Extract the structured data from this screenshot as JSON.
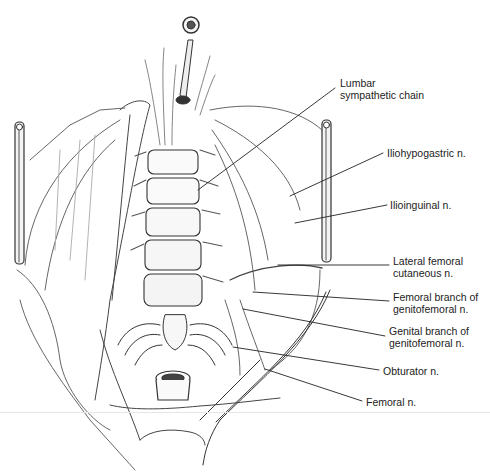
{
  "figure": {
    "colors": {
      "ink": "#222222",
      "shade": "#9a9a9a",
      "light": "#d8d8d8",
      "background": "#ffffff"
    },
    "labels": [
      {
        "id": "lumbar-sympathetic-chain",
        "text": "Lumbar\nsympathetic chain",
        "x": 340,
        "y": 77,
        "anchor": [
          198,
          190
        ],
        "leader_end": [
          335,
          88
        ]
      },
      {
        "id": "iliohypogastric",
        "text": "Iliohypogastric n.",
        "x": 387,
        "y": 146,
        "anchor": [
          290,
          196
        ],
        "leader_end": [
          383,
          153
        ]
      },
      {
        "id": "ilioinguinal",
        "text": "Ilioinguinal n.",
        "x": 390,
        "y": 198,
        "anchor": [
          295,
          223
        ],
        "leader_end": [
          387,
          205
        ]
      },
      {
        "id": "lateral-femoral-cutaneous",
        "text": "Lateral femoral\ncutaneous n.",
        "x": 393,
        "y": 255,
        "anchor": [
          278,
          265
        ],
        "leader_end": [
          389,
          265
        ]
      },
      {
        "id": "femoral-branch-genitofemoral",
        "text": "Femoral branch of\ngenitofemoral n.",
        "x": 393,
        "y": 291,
        "anchor": [
          253,
          292
        ],
        "leader_end": [
          389,
          301
        ]
      },
      {
        "id": "genital-branch-genitofemoral",
        "text": "Genital branch of\ngenitofemoral n.",
        "x": 389,
        "y": 325,
        "anchor": [
          243,
          309
        ],
        "leader_end": [
          385,
          336
        ]
      },
      {
        "id": "obturator",
        "text": "Obturator n.",
        "x": 383,
        "y": 365,
        "anchor": [
          233,
          347
        ],
        "leader_end": [
          379,
          370
        ]
      },
      {
        "id": "femoral",
        "text": "Femoral n.",
        "x": 366,
        "y": 397,
        "anchor": [
          265,
          369
        ],
        "leader_end": [
          362,
          401
        ]
      }
    ]
  }
}
